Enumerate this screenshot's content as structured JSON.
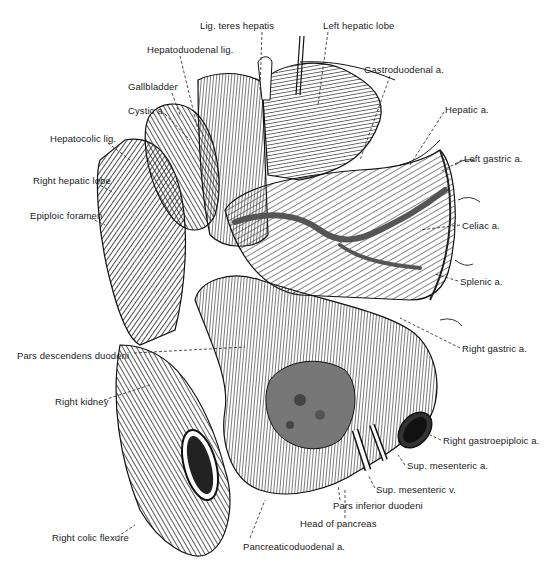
{
  "figure": {
    "type": "anatomical-illustration",
    "colors": {
      "ink": "#1a1a1a",
      "background": "#ffffff",
      "vessel": "#555555"
    }
  },
  "labels": [
    {
      "id": "lig-teres-hepatis",
      "text": "Lig. teres hepatis",
      "x": 200,
      "y": 20
    },
    {
      "id": "left-hepatic-lobe",
      "text": "Left hepatic lobe",
      "x": 323,
      "y": 20
    },
    {
      "id": "hepatoduodenal-lig",
      "text": "Hepatoduodenal lig.",
      "x": 147,
      "y": 44
    },
    {
      "id": "gastroduodenal-a",
      "text": "Gastroduodenal a.",
      "x": 364,
      "y": 64
    },
    {
      "id": "gallbladder",
      "text": "Gallbladder",
      "x": 128,
      "y": 81
    },
    {
      "id": "cystic-a",
      "text": "Cystic a.",
      "x": 128,
      "y": 105
    },
    {
      "id": "hepatic-a",
      "text": "Hepatic a.",
      "x": 445,
      "y": 104
    },
    {
      "id": "hepatocolic-lig",
      "text": "Hepatocolic lig.",
      "x": 50,
      "y": 133
    },
    {
      "id": "left-gastric-a",
      "text": "Left gastric a.",
      "x": 464,
      "y": 153
    },
    {
      "id": "right-hepatic-lobe",
      "text": "Right hepatic lobe",
      "x": 33,
      "y": 175
    },
    {
      "id": "epiploic-foramen",
      "text": "Epiploic foramen",
      "x": 30,
      "y": 210
    },
    {
      "id": "celiac-a",
      "text": "Celiac a.",
      "x": 462,
      "y": 220
    },
    {
      "id": "splenic-a",
      "text": "Splenic a.",
      "x": 460,
      "y": 276
    },
    {
      "id": "right-gastric-a",
      "text": "Right gastric a.",
      "x": 462,
      "y": 343
    },
    {
      "id": "pars-descendens-duodeni",
      "text": "Pars descendens duodeni",
      "x": 17,
      "y": 350
    },
    {
      "id": "right-kidney",
      "text": "Right kidney",
      "x": 55,
      "y": 396
    },
    {
      "id": "right-gastroepiploic-a",
      "text": "Right gastroepiploic a.",
      "x": 443,
      "y": 435
    },
    {
      "id": "sup-mesenteric-a",
      "text": "Sup. mesenteric a.",
      "x": 407,
      "y": 460
    },
    {
      "id": "sup-mesenteric-v",
      "text": "Sup. mesenteric v.",
      "x": 376,
      "y": 484
    },
    {
      "id": "pars-inferior-duodeni",
      "text": "Pars inferior duodeni",
      "x": 333,
      "y": 500
    },
    {
      "id": "right-colic-flexure",
      "text": "Right colic flexure",
      "x": 52,
      "y": 532
    },
    {
      "id": "head-of-pancreas",
      "text": "Head of pancreas",
      "x": 300,
      "y": 518
    },
    {
      "id": "pancreaticoduodenal-a",
      "text": "Pancreaticoduodenal a.",
      "x": 243,
      "y": 541
    }
  ]
}
